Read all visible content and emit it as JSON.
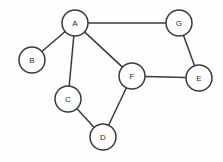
{
  "figure": {
    "background_color": "#fefefe",
    "stroke_color": "#3a3a3a",
    "node_fill_color": "#ffffff",
    "label_color": "#2b2b2b",
    "width": 223,
    "height": 162
  },
  "chart_data": {
    "type": "diagram",
    "diagram_kind": "undirected-graph",
    "node_radius": 13,
    "node_count": 7,
    "edge_count": 8,
    "directed": false,
    "weighted": false,
    "nodes": [
      {
        "id": "A",
        "label": "A",
        "x": 75,
        "y": 23,
        "degree": 4
      },
      {
        "id": "B",
        "label": "B",
        "x": 32,
        "y": 60,
        "degree": 1
      },
      {
        "id": "C",
        "label": "C",
        "x": 68,
        "y": 99,
        "degree": 2
      },
      {
        "id": "D",
        "label": "D",
        "x": 103,
        "y": 137,
        "degree": 2
      },
      {
        "id": "E",
        "label": "E",
        "x": 199,
        "y": 78,
        "degree": 2
      },
      {
        "id": "F",
        "label": "F",
        "x": 132,
        "y": 76,
        "degree": 3
      },
      {
        "id": "G",
        "label": "G",
        "x": 179,
        "y": 23,
        "degree": 2
      }
    ],
    "edges": [
      {
        "source": "A",
        "target": "G",
        "label": ""
      },
      {
        "source": "A",
        "target": "B",
        "label": ""
      },
      {
        "source": "A",
        "target": "C",
        "label": ""
      },
      {
        "source": "A",
        "target": "F",
        "label": ""
      },
      {
        "source": "G",
        "target": "E",
        "label": ""
      },
      {
        "source": "F",
        "target": "E",
        "label": ""
      },
      {
        "source": "F",
        "target": "D",
        "label": ""
      },
      {
        "source": "C",
        "target": "D",
        "label": ""
      }
    ],
    "adjacency": {
      "A": [
        "B",
        "C",
        "F",
        "G"
      ],
      "B": [
        "A"
      ],
      "C": [
        "A",
        "D"
      ],
      "D": [
        "C",
        "F"
      ],
      "E": [
        "F",
        "G"
      ],
      "F": [
        "A",
        "D",
        "E"
      ],
      "G": [
        "A",
        "E"
      ]
    }
  }
}
